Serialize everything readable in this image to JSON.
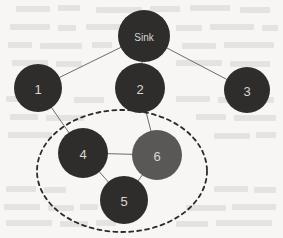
{
  "figure": {
    "background_color": "#f7f6f4",
    "edge_color": "#6e6b67",
    "cluster_outline_color": "#2b2b2b",
    "node_label_color": "#d9d7d3"
  },
  "graph": {
    "nodes": [
      {
        "id": "sink",
        "label": "Sink",
        "cx": 144,
        "cy": 36,
        "r": 26,
        "color": "#2e2d2c",
        "name": "node-sink"
      },
      {
        "id": "n1",
        "label": "1",
        "cx": 38,
        "cy": 88,
        "r": 24,
        "color": "#2e2d2c",
        "name": "node-1"
      },
      {
        "id": "n2",
        "label": "2",
        "cx": 140,
        "cy": 88,
        "r": 25,
        "color": "#2e2d2c",
        "name": "node-2"
      },
      {
        "id": "n3",
        "label": "3",
        "cx": 247,
        "cy": 90,
        "r": 23,
        "color": "#2e2d2c",
        "name": "node-3"
      },
      {
        "id": "n4",
        "label": "4",
        "cx": 83,
        "cy": 153,
        "r": 25,
        "color": "#2e2d2c",
        "name": "node-4"
      },
      {
        "id": "n5",
        "label": "5",
        "cx": 124,
        "cy": 200,
        "r": 24,
        "color": "#2e2d2c",
        "name": "node-5"
      },
      {
        "id": "n6",
        "label": "6",
        "cx": 157,
        "cy": 155,
        "r": 25,
        "color": "#5a5856",
        "name": "node-6"
      }
    ],
    "edges": [
      {
        "from": "sink",
        "to": "n1",
        "name": "edge-sink-1"
      },
      {
        "from": "sink",
        "to": "n2",
        "name": "edge-sink-2"
      },
      {
        "from": "sink",
        "to": "n3",
        "name": "edge-sink-3"
      },
      {
        "from": "n1",
        "to": "n4",
        "name": "edge-1-4"
      },
      {
        "from": "n2",
        "to": "n6",
        "name": "edge-2-6"
      },
      {
        "from": "n4",
        "to": "n6",
        "name": "edge-4-6"
      },
      {
        "from": "n4",
        "to": "n5",
        "name": "edge-4-5"
      },
      {
        "from": "n5",
        "to": "n6",
        "name": "edge-5-6"
      }
    ],
    "cluster": {
      "cx": 122,
      "cy": 171,
      "rx": 85,
      "ry": 61,
      "dash": "4 4",
      "members": [
        "n4",
        "n5",
        "n6"
      ]
    }
  }
}
